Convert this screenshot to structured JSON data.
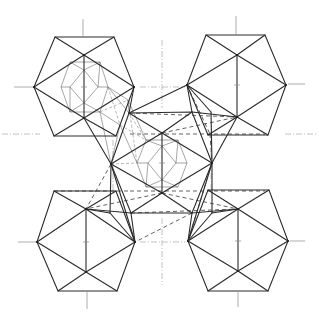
{
  "figure": {
    "background": "#ffffff",
    "stroke_color": "#2a2a2a"
  },
  "icosahedra": [
    {
      "id": "top-left",
      "center": [
        84,
        87
      ],
      "hex": [
        [
          55,
          37
        ],
        [
          114,
          37
        ],
        [
          134,
          87
        ],
        [
          116,
          136
        ],
        [
          54,
          136
        ],
        [
          34,
          87
        ]
      ],
      "inner": [
        [
          84,
          55
        ],
        [
          84,
          118
        ]
      ]
    },
    {
      "id": "top-right",
      "center": [
        237,
        85
      ],
      "hex": [
        [
          206,
          35
        ],
        [
          265,
          35
        ],
        [
          286,
          85
        ],
        [
          268,
          135
        ],
        [
          208,
          135
        ],
        [
          187,
          85
        ]
      ],
      "inner": [
        [
          237,
          55
        ],
        [
          237,
          117
        ]
      ]
    },
    {
      "id": "bottom-left",
      "center": [
        86,
        242
      ],
      "hex": [
        [
          54,
          191
        ],
        [
          116,
          191
        ],
        [
          135,
          242
        ],
        [
          117,
          291
        ],
        [
          58,
          291
        ],
        [
          37,
          242
        ]
      ],
      "inner": [
        [
          86,
          209
        ],
        [
          86,
          272
        ]
      ]
    },
    {
      "id": "bottom-right",
      "center": [
        238,
        241
      ],
      "hex": [
        [
          208,
          190
        ],
        [
          269,
          190
        ],
        [
          288,
          241
        ],
        [
          268,
          291
        ],
        [
          208,
          291
        ],
        [
          188,
          241
        ]
      ],
      "inner": [
        [
          238,
          209
        ],
        [
          238,
          271
        ]
      ]
    },
    {
      "id": "center",
      "center": [
        162,
        163
      ],
      "hex": [
        [
          129,
          113
        ],
        [
          192,
          112
        ],
        [
          212,
          163
        ],
        [
          192,
          213
        ],
        [
          131,
          213
        ],
        [
          111,
          164
        ]
      ],
      "inner": [
        [
          162,
          133
        ],
        [
          162,
          193
        ]
      ]
    }
  ],
  "inner_thin": {
    "top-left-hex": [
      [
        70,
        62
      ],
      [
        100,
        62
      ],
      [
        108,
        87
      ],
      [
        100,
        112
      ],
      [
        70,
        112
      ],
      [
        61,
        87
      ]
    ],
    "top-left-diamond": [
      [
        84,
        70
      ],
      [
        98,
        87
      ],
      [
        84,
        103
      ],
      [
        70,
        87
      ]
    ],
    "center-hex": [
      [
        146,
        140
      ],
      [
        178,
        140
      ],
      [
        187,
        163
      ],
      [
        178,
        187
      ],
      [
        146,
        187
      ],
      [
        137,
        163
      ]
    ],
    "center-diamond": [
      [
        162,
        146
      ],
      [
        176,
        163
      ],
      [
        162,
        180
      ],
      [
        148,
        163
      ]
    ]
  },
  "guides": [
    {
      "x1": 14,
      "y1": 87,
      "x2": 34,
      "y2": 87
    },
    {
      "x1": 83,
      "y1": 19,
      "x2": 83,
      "y2": 36
    },
    {
      "x1": 288,
      "y1": 84,
      "x2": 305,
      "y2": 84
    },
    {
      "x1": 236,
      "y1": 16,
      "x2": 236,
      "y2": 34
    },
    {
      "x1": 18,
      "y1": 242,
      "x2": 37,
      "y2": 242
    },
    {
      "x1": 87,
      "y1": 292,
      "x2": 87,
      "y2": 309
    },
    {
      "x1": 290,
      "y1": 241,
      "x2": 305,
      "y2": 241
    },
    {
      "x1": 238,
      "y1": 292,
      "x2": 238,
      "y2": 307
    }
  ],
  "axes": {
    "h_dash_lines": [
      {
        "x1": 140,
        "y1": 87,
        "x2": 185,
        "y2": 87
      },
      {
        "x1": 140,
        "y1": 242,
        "x2": 185,
        "y2": 242
      },
      {
        "x1": 2,
        "y1": 134,
        "x2": 40,
        "y2": 134
      },
      {
        "x1": 285,
        "y1": 134,
        "x2": 316,
        "y2": 134
      }
    ],
    "v_dash_lines": [
      {
        "x1": 162,
        "y1": 40,
        "x2": 162,
        "y2": 108
      },
      {
        "x1": 162,
        "y1": 218,
        "x2": 162,
        "y2": 285
      },
      {
        "x1": 113,
        "y1": 140,
        "x2": 113,
        "y2": 190
      },
      {
        "x1": 211,
        "y1": 140,
        "x2": 211,
        "y2": 190
      }
    ]
  }
}
